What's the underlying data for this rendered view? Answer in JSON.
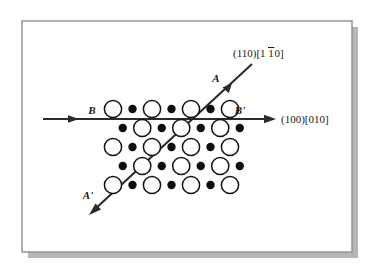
{
  "figure": {
    "title_alt": "Slip systems on a crystal lattice cross-section",
    "frame": {
      "border_color": "#8d8d8d",
      "background": "#ffffff",
      "shadow_color": "#b6b6b6"
    },
    "colors": {
      "line": "#2b2b2b",
      "atom_outline": "#141414",
      "atom_filled": "#0d0d0d",
      "atom_open_fill": "#ffffff",
      "text": "#1a1a1a"
    },
    "labels": {
      "a": "A",
      "a_prime": "A'",
      "b": "B",
      "b_prime": "B'",
      "plane_110": "(110)[1",
      "plane_110_bar": "1",
      "plane_110_tail": "0]",
      "plane_110_full": "(110)[110]",
      "plane_100": "(100)[010]"
    },
    "lattice": {
      "rows": 5,
      "cols": 7,
      "x_start": 113,
      "y_start": 109,
      "col_spacing": 19.5,
      "row_spacing": 19.0,
      "row_offset": 9.75,
      "open_radius": 8.6,
      "filled_radius": 4.2,
      "open_stroke_width": 1.5,
      "row_patterns": [
        [
          "open",
          "filled",
          "open",
          "filled",
          "open",
          "filled",
          "open"
        ],
        [
          "filled",
          "open",
          "filled",
          "open",
          "filled",
          "open",
          "filled"
        ],
        [
          "open",
          "filled",
          "open",
          "filled",
          "open",
          "filled",
          "open"
        ],
        [
          "filled",
          "open",
          "filled",
          "open",
          "filled",
          "open",
          "filled"
        ],
        [
          "open",
          "filled",
          "open",
          "filled",
          "open",
          "filled",
          "open"
        ]
      ]
    },
    "lines": {
      "bb": {
        "x1": 43,
        "y1": 119,
        "x2": 274,
        "y2": 119,
        "width": 2.0,
        "arrow_mid_x": 72,
        "label_x": 92,
        "label_y": 114
      },
      "aa": {
        "x1": 92,
        "y1": 212,
        "x2": 254,
        "y2": 63,
        "width": 2.0,
        "label_x": 220,
        "label_y": 80
      }
    },
    "text_positions": {
      "plane_110": {
        "x": 233,
        "y": 55
      },
      "plane_100": {
        "x": 279,
        "y": 123
      },
      "b": {
        "x": 92,
        "y": 115
      },
      "b_prime": {
        "x": 238,
        "y": 115
      },
      "a": {
        "x": 218,
        "y": 82
      },
      "a_prime": {
        "x": 88,
        "y": 198
      }
    }
  }
}
